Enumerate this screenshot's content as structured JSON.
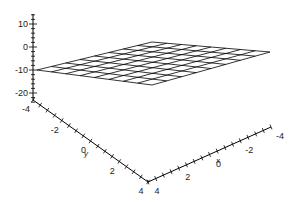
{
  "chart_data": {
    "type": "surface3d",
    "title": "",
    "surface": {
      "expression": "z = -10",
      "x_range": [
        -4,
        4
      ],
      "y_range": [
        -4,
        4
      ],
      "z_value": -10,
      "grid_lines": 9,
      "color": "#000000"
    },
    "axes": {
      "x": {
        "label": "x",
        "range": [
          -4,
          4
        ],
        "tick_labels": [
          "4",
          "2",
          "0",
          "-2",
          "-4"
        ],
        "tick_values": [
          4,
          2,
          0,
          -2,
          -4
        ]
      },
      "y": {
        "label": "y",
        "range": [
          -4,
          4
        ],
        "tick_labels": [
          "-4",
          "-2",
          "0",
          "2",
          "4"
        ],
        "tick_values": [
          -4,
          -2,
          0,
          2,
          4
        ]
      },
      "z": {
        "label": "",
        "range": [
          -24,
          14
        ],
        "tick_labels": [
          "10",
          "0",
          "-10",
          "-20"
        ],
        "tick_values": [
          10,
          0,
          -10,
          -20
        ]
      }
    },
    "grid": false,
    "legend": "none"
  }
}
